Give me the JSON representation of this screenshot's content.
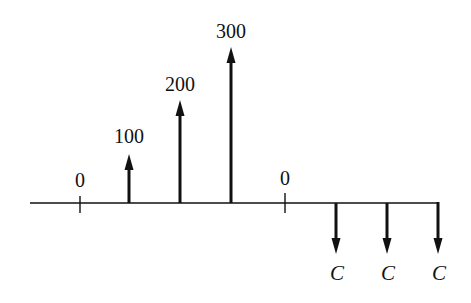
{
  "diagram": {
    "type": "cash-flow",
    "axis": {
      "x_start": 30,
      "x_end": 438,
      "y": 203
    },
    "ticks": [
      {
        "x": 80,
        "label": "0"
      },
      {
        "x": 285,
        "label": "0"
      }
    ],
    "inflows": [
      {
        "x": 129,
        "top": 158,
        "label": "100"
      },
      {
        "x": 180,
        "top": 103,
        "label": "200"
      },
      {
        "x": 231,
        "top": 48,
        "label": "300"
      }
    ],
    "outflows": [
      {
        "x": 336,
        "bottom": 253,
        "label": "C"
      },
      {
        "x": 387,
        "bottom": 253,
        "label": "C"
      },
      {
        "x": 438,
        "bottom": 253,
        "label": "C"
      }
    ]
  }
}
